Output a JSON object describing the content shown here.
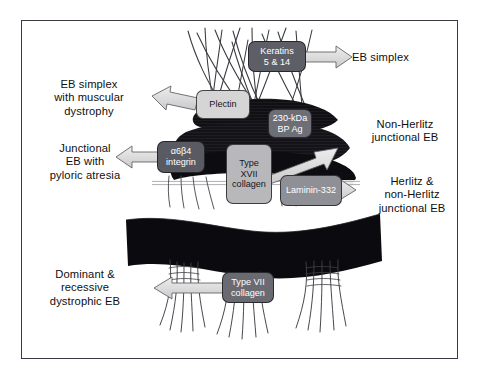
{
  "figure": {
    "background_color": "#ffffff",
    "border_color": "#3a3a46"
  },
  "molecule_boxes": [
    {
      "id": "keratins",
      "label": "Keratins\n5 & 14",
      "line1": "Keratins",
      "line2": "5 & 14",
      "line3": "",
      "color": "#5e5e66",
      "text_color": "#ffffff",
      "x": 248,
      "y": 41,
      "w": 58,
      "h": 31
    },
    {
      "id": "plectin",
      "label": "Plectin",
      "line1": "Plectin",
      "line2": "",
      "line3": "",
      "color": "#d5d5d6",
      "text_color": "#16161a",
      "x": 196,
      "y": 90,
      "w": 54,
      "h": 29
    },
    {
      "id": "bp230",
      "label": "230-kDa\nBP Ag",
      "line1": "230-kDa",
      "line2": "BP Ag",
      "line3": "",
      "color": "#6e6e76",
      "text_color": "#ffffff",
      "x": 268,
      "y": 109,
      "w": 44,
      "h": 29
    },
    {
      "id": "integrin",
      "label": "α6β4\nintegrin",
      "line1": "α6β4",
      "line2": "integrin",
      "line3": "",
      "color": "#5a5a62",
      "text_color": "#ffffff",
      "x": 157,
      "y": 141,
      "w": 48,
      "h": 32
    },
    {
      "id": "col17",
      "label": "Type\nXVII\ncollagen",
      "line1": "Type",
      "line2": "XVII",
      "line3": "collagen",
      "color": "#b8b8ba",
      "text_color": "#16161a",
      "x": 226,
      "y": 144,
      "w": 46,
      "h": 60
    },
    {
      "id": "laminin332",
      "label": "Laminin-332",
      "line1": "Laminin-332",
      "line2": "",
      "line3": "",
      "color": "#8f8f96",
      "text_color": "#ffffff",
      "x": 280,
      "y": 175,
      "w": 62,
      "h": 31
    },
    {
      "id": "col7",
      "label": "Type VII\ncollagen",
      "line1": "Type VII",
      "line2": "collagen",
      "line3": "",
      "color": "#6a6a72",
      "text_color": "#ffffff",
      "x": 222,
      "y": 272,
      "w": 52,
      "h": 31
    }
  ],
  "disease_labels": [
    {
      "id": "eb-simplex",
      "lines": [
        "EB simplex"
      ],
      "x": 352,
      "y": 51,
      "w": 110,
      "align": "left"
    },
    {
      "id": "eb-simplex-muscular",
      "lines": [
        "EB simplex",
        "with muscular",
        "dystrophy"
      ],
      "x": 24,
      "y": 78,
      "w": 130,
      "align": "center"
    },
    {
      "id": "non-herlitz-junctional",
      "lines": [
        "Non-Herlitz",
        "junctional EB"
      ],
      "x": 349,
      "y": 118,
      "w": 112,
      "align": "center"
    },
    {
      "id": "junctional-pyloric",
      "lines": [
        "Junctional",
        "EB with",
        "pyloric atresia"
      ],
      "x": 19,
      "y": 142,
      "w": 132,
      "align": "center"
    },
    {
      "id": "herlitz-non-herlitz",
      "lines": [
        "Herlitz &",
        "non-Herlitz",
        "junctional EB"
      ],
      "x": 356,
      "y": 175,
      "w": 112,
      "align": "center"
    },
    {
      "id": "dominant-recessive-deb",
      "lines": [
        "Dominant &",
        "recessive",
        "dystrophic EB"
      ],
      "x": 16,
      "y": 268,
      "w": 138,
      "align": "center"
    }
  ],
  "arrows": [
    {
      "id": "arrow-eb-simplex",
      "from": "keratins",
      "to": "eb-simplex",
      "direction": "right",
      "color": "#d9d9da"
    },
    {
      "id": "arrow-eb-simplex-muscular",
      "from": "plectin",
      "to": "eb-simplex-muscular",
      "direction": "left",
      "color": "#d9d9da"
    },
    {
      "id": "arrow-non-herlitz",
      "from": "col17",
      "to": "non-herlitz-junctional",
      "direction": "up-right",
      "color": "#d9d9da"
    },
    {
      "id": "arrow-junctional-pyloric",
      "from": "integrin",
      "to": "junctional-pyloric",
      "direction": "left",
      "color": "#d9d9da"
    },
    {
      "id": "arrow-herlitz",
      "from": "laminin332",
      "to": "herlitz-non-herlitz",
      "direction": "right",
      "color": "#d9d9da"
    },
    {
      "id": "arrow-dystrophic",
      "from": "col7",
      "to": "dominant-recessive-deb",
      "direction": "left",
      "color": "#d9d9da"
    }
  ],
  "structures": [
    {
      "id": "keratin-filaments",
      "name": "keratin intermediate filaments",
      "color": "#2a2a2e"
    },
    {
      "id": "hemidesmosome-plaque",
      "name": "hemidesmosomal inner/outer plaque",
      "color": "#121216"
    },
    {
      "id": "lamina-lucida",
      "name": "lamina lucida",
      "color": "#ffffff"
    },
    {
      "id": "lamina-densa",
      "name": "lamina densa",
      "color": "#101014"
    },
    {
      "id": "anchoring-filaments",
      "name": "anchoring filaments",
      "color": "#55555c"
    },
    {
      "id": "anchoring-fibrils",
      "name": "anchoring fibrils",
      "color": "#3a3a40"
    }
  ]
}
